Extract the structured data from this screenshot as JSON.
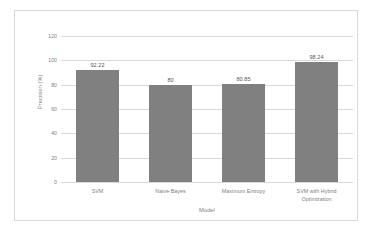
{
  "chart_data": {
    "type": "bar",
    "title": "",
    "xlabel": "Model",
    "ylabel": "Precision (%)",
    "categories": [
      "SVM",
      "Naive Bayes",
      "Maximum Entropy",
      "SVM with Hybrid\nOptimization"
    ],
    "values": [
      92.22,
      80,
      80.85,
      98.24
    ],
    "value_labels": [
      "92.22",
      "80",
      "80.85",
      "98.24"
    ],
    "ylim": [
      0,
      120
    ],
    "yticks": [
      "0",
      "20",
      "40",
      "60",
      "80",
      "100",
      "120"
    ],
    "grid": "horizontal",
    "legend": "none",
    "bar_color": "#808080",
    "grid_color": "#d9d9d9",
    "text_color": "#7f7f7f",
    "border_color": "#d9d9d9",
    "background": "#ffffff"
  }
}
